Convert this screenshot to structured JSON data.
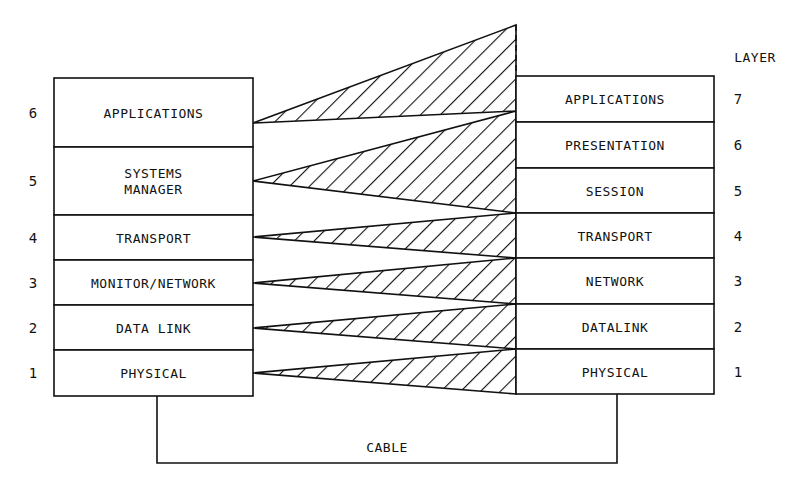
{
  "diagram": {
    "colors": {
      "ink": "#111111",
      "background": "#ffffff"
    },
    "layer_header": "LAYER",
    "cable_label": "CABLE",
    "left_stack": {
      "box": {
        "x": 54,
        "width": 199
      },
      "rows": [
        {
          "number": "6",
          "label_lines": [
            "APPLICATIONS"
          ],
          "top": 78,
          "bottom": 147,
          "apex_y": 123
        },
        {
          "number": "5",
          "label_lines": [
            "SYSTEMS",
            "MANAGER"
          ],
          "top": 147,
          "bottom": 215,
          "apex_y": 181
        },
        {
          "number": "4",
          "label_lines": [
            "TRANSPORT"
          ],
          "top": 215,
          "bottom": 260,
          "apex_y": 237
        },
        {
          "number": "3",
          "label_lines": [
            "MONITOR/NETWORK"
          ],
          "top": 260,
          "bottom": 305,
          "apex_y": 283
        },
        {
          "number": "2",
          "label_lines": [
            "DATA LINK"
          ],
          "top": 305,
          "bottom": 350,
          "apex_y": 328
        },
        {
          "number": "1",
          "label_lines": [
            "PHYSICAL"
          ],
          "top": 350,
          "bottom": 396,
          "apex_y": 373
        }
      ]
    },
    "right_stack": {
      "box": {
        "x": 516,
        "width": 198
      },
      "rows": [
        {
          "number": "7",
          "label": "APPLICATIONS",
          "top": 76,
          "bottom": 122
        },
        {
          "number": "6",
          "label": "PRESENTATION",
          "top": 122,
          "bottom": 168
        },
        {
          "number": "5",
          "label": "SESSION",
          "top": 168,
          "bottom": 213
        },
        {
          "number": "4",
          "label": "TRANSPORT",
          "top": 213,
          "bottom": 258
        },
        {
          "number": "3",
          "label": "NETWORK",
          "top": 258,
          "bottom": 304
        },
        {
          "number": "2",
          "label": "DATALINK",
          "top": 304,
          "bottom": 349
        },
        {
          "number": "1",
          "label": "PHYSICAL",
          "top": 349,
          "bottom": 394
        }
      ]
    },
    "mappings": [
      {
        "from": "APPLICATIONS",
        "to": [
          "APPLICATIONS"
        ],
        "right_top": 25,
        "right_bottom": 111
      },
      {
        "from": "SYSTEMS MANAGER",
        "to": [
          "PRESENTATION",
          "SESSION"
        ],
        "right_top": 111,
        "right_bottom": 213
      },
      {
        "from": "TRANSPORT",
        "to": [
          "TRANSPORT"
        ],
        "right_top": 213,
        "right_bottom": 258
      },
      {
        "from": "MONITOR/NETWORK",
        "to": [
          "NETWORK"
        ],
        "right_top": 258,
        "right_bottom": 304
      },
      {
        "from": "DATA LINK",
        "to": [
          "DATALINK"
        ],
        "right_top": 304,
        "right_bottom": 349
      },
      {
        "from": "PHYSICAL",
        "to": [
          "PHYSICAL"
        ],
        "right_top": 349,
        "right_bottom": 394
      }
    ],
    "cable": {
      "left_x": 157,
      "right_x": 617,
      "bottom_y": 463
    }
  }
}
